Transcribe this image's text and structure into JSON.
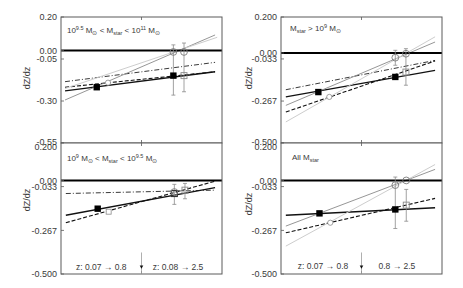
{
  "figure": {
    "y_axis_title": "dZ/dz",
    "x_axis_ticks": "unlabeled (single mid-panel tick)"
  },
  "chart_data": [
    {
      "id": "top-left",
      "type": "line",
      "row": 0,
      "frame": [
        61,
        17,
        222,
        143
      ],
      "title": "10^9.5 M⊙ < M_star < 10^11 M⊙",
      "label": {
        "x": 0.037,
        "y": 0.106,
        "segments": [
          [
            "n",
            "10"
          ],
          [
            "sup",
            "9.5"
          ],
          [
            "n",
            " M"
          ],
          [
            "sub",
            "⊙"
          ],
          [
            "n",
            " < M"
          ],
          [
            "sub",
            "star"
          ],
          [
            "n",
            " < 10"
          ],
          [
            "sup",
            "11"
          ],
          [
            "n",
            " M"
          ],
          [
            "sub",
            "⊙"
          ]
        ]
      },
      "xlabel": "",
      "ylabel": "dZ/dz",
      "xlim": [
        0,
        1
      ],
      "ylim": [
        -0.55,
        0.2
      ],
      "grid": false,
      "yticks": [
        {
          "v": 0.2,
          "label": "0.20"
        },
        {
          "v": 0.0,
          "label": "0.00"
        },
        {
          "v": -0.05,
          "label": "-0.05"
        },
        {
          "v": -0.3,
          "label": "-0.30"
        },
        {
          "v": -0.55,
          "label": "-0.55"
        }
      ],
      "series": [
        {
          "name": "solid fit",
          "style": "solid",
          "x": [
            0.025,
            0.957
          ],
          "y": [
            -0.24,
            -0.126
          ]
        },
        {
          "name": "dashed fit",
          "style": "dashed",
          "x": [
            0.025,
            0.957
          ],
          "y": [
            -0.218,
            -0.126
          ]
        },
        {
          "name": "dash-dot fit",
          "style": "dashdot",
          "x": [
            0.025,
            0.957
          ],
          "y": [
            -0.185,
            -0.07
          ]
        },
        {
          "name": "gray fit",
          "style": "gray",
          "x": [
            0.025,
            0.957
          ],
          "y": [
            -0.294,
            0.093
          ]
        },
        {
          "name": "light gray fit",
          "style": "lightgray",
          "x": [
            0.025,
            0.97
          ],
          "y": [
            -0.226,
            0.079
          ]
        }
      ],
      "points": [
        {
          "marker": "filled-square",
          "x": 0.222,
          "y": -0.218
        },
        {
          "marker": "filled-square",
          "x": 0.698,
          "y": -0.149
        },
        {
          "marker": "small-open-circle",
          "x": 0.292,
          "y": -0.191
        },
        {
          "marker": "open-circle",
          "x": 0.698,
          "y": -0.008,
          "err": [
            -0.265,
            0.034
          ]
        },
        {
          "marker": "open-circle",
          "x": 0.764,
          "y": -0.008,
          "err": [
            -0.245,
            0.045
          ]
        },
        {
          "marker": "open-square",
          "x": 0.764,
          "y": -0.149
        }
      ],
      "annotations": []
    },
    {
      "id": "top-right",
      "type": "line",
      "row": 0,
      "frame": [
        281,
        17,
        442,
        143
      ],
      "title": "M_star > 10^9 M⊙",
      "label": {
        "x": 0.056,
        "y": 0.122,
        "segments": [
          [
            "n",
            "M"
          ],
          [
            "sub",
            "star"
          ],
          [
            "n",
            " > 10"
          ],
          [
            "sup",
            "9"
          ],
          [
            "n",
            " M"
          ],
          [
            "sub",
            "⊙"
          ]
        ]
      },
      "xlabel": "",
      "ylabel": "dZ/dz",
      "xlim": [
        0,
        1
      ],
      "ylim": [
        -0.5,
        0.2
      ],
      "grid": false,
      "yticks": [
        {
          "v": 0.2,
          "label": "0.200"
        },
        {
          "v": 0.0,
          "label": "0.00"
        },
        {
          "v": -0.033,
          "label": "-0.033"
        },
        {
          "v": -0.267,
          "label": "-0.267"
        },
        {
          "v": -0.5,
          "label": "-0.500"
        }
      ],
      "series": [
        {
          "name": "solid fit",
          "style": "solid",
          "x": [
            0.03,
            0.957
          ],
          "y": [
            -0.244,
            -0.096
          ]
        },
        {
          "name": "dash-dot fit",
          "style": "dashdot",
          "x": [
            0.03,
            0.957
          ],
          "y": [
            -0.204,
            -0.041
          ]
        },
        {
          "name": "dashed fit",
          "style": "dashed",
          "x": [
            0.03,
            0.957
          ],
          "y": [
            -0.328,
            -0.044
          ]
        },
        {
          "name": "gray fit",
          "style": "gray",
          "x": [
            0.03,
            0.957
          ],
          "y": [
            -0.291,
            0.061
          ]
        },
        {
          "name": "light gray fit",
          "style": "lightgray",
          "x": [
            0.03,
            0.957
          ],
          "y": [
            -0.383,
            0.09
          ]
        }
      ],
      "points": [
        {
          "marker": "filled-square",
          "x": 0.232,
          "y": -0.217
        },
        {
          "marker": "filled-square",
          "x": 0.71,
          "y": -0.133
        },
        {
          "marker": "small-open-circle",
          "x": 0.3,
          "y": -0.244
        },
        {
          "marker": "open-circle",
          "x": 0.71,
          "y": -0.026,
          "err": [
            -0.068,
            0.015
          ]
        },
        {
          "marker": "open-circle",
          "x": 0.776,
          "y": -0.004,
          "err": [
            -0.179,
            0.024
          ]
        },
        {
          "marker": "open-square",
          "x": 0.776,
          "y": -0.106
        }
      ],
      "annotations": []
    },
    {
      "id": "bottom-left",
      "type": "line",
      "row": 1,
      "frame": [
        61,
        143,
        222,
        274
      ],
      "title": "10^9 M⊙ < M_star < 10^9.5 M⊙",
      "label": {
        "x": 0.037,
        "y": 0.104,
        "segments": [
          [
            "n",
            "10"
          ],
          [
            "sup",
            "9"
          ],
          [
            "n",
            " M"
          ],
          [
            "sub",
            "⊙"
          ],
          [
            "n",
            " < M"
          ],
          [
            "sub",
            "star"
          ],
          [
            "n",
            " < 10"
          ],
          [
            "sup",
            "9.5"
          ],
          [
            "n",
            " M"
          ],
          [
            "sub",
            "⊙"
          ]
        ]
      },
      "xlabel": "",
      "ylabel": "dZ/dz",
      "xlim": [
        0,
        1
      ],
      "ylim": [
        -0.5,
        0.2
      ],
      "grid": false,
      "yticks": [
        {
          "v": 0.2,
          "label": "0.200"
        },
        {
          "v": 0.0,
          "label": "0.00"
        },
        {
          "v": -0.033,
          "label": "-0.033"
        },
        {
          "v": -0.267,
          "label": "-0.267"
        },
        {
          "v": -0.5,
          "label": "-0.500"
        }
      ],
      "series": [
        {
          "name": "dash-dot fit",
          "style": "dashdot",
          "x": [
            0.03,
            0.957
          ],
          "y": [
            -0.07,
            -0.052
          ]
        },
        {
          "name": "solid fit",
          "style": "solid",
          "x": [
            0.03,
            0.957
          ],
          "y": [
            -0.186,
            -0.039
          ]
        },
        {
          "name": "dashed fit",
          "style": "dashed",
          "x": [
            0.03,
            0.957
          ],
          "y": [
            -0.226,
            -0.004
          ]
        }
      ],
      "points": [
        {
          "marker": "filled-square",
          "x": 0.228,
          "y": -0.151
        },
        {
          "marker": "small-open-square",
          "x": 0.296,
          "y": -0.167
        },
        {
          "marker": "open-square-dark",
          "x": 0.704,
          "y": -0.07,
          "err": [
            -0.128,
            -0.021
          ]
        },
        {
          "marker": "open-circle",
          "x": 0.704,
          "y": -0.062
        },
        {
          "marker": "open-square",
          "x": 0.77,
          "y": -0.052,
          "err": [
            -0.098,
            -0.016
          ]
        }
      ],
      "annotations": [
        {
          "kind": "text",
          "x": 0.25,
          "y": -0.463,
          "text": "z: 0.07 → 0.8"
        },
        {
          "kind": "text",
          "x": 0.727,
          "y": -0.463,
          "text": "z: 0.08 → 2.5"
        },
        {
          "kind": "down-arrow",
          "x": 0.5,
          "y_from": -0.385,
          "y_to": -0.5
        }
      ]
    },
    {
      "id": "bottom-right",
      "type": "line",
      "row": 1,
      "frame": [
        281,
        143,
        442,
        274
      ],
      "title": "All M_star",
      "label": {
        "x": 0.068,
        "y": 0.109,
        "segments": [
          [
            "n",
            "All M"
          ],
          [
            "sub",
            "star"
          ]
        ]
      },
      "xlabel": "",
      "ylabel": "dZ/dz",
      "xlim": [
        0,
        1
      ],
      "ylim": [
        -0.5,
        0.2
      ],
      "grid": false,
      "yticks": [
        {
          "v": 0.2,
          "label": "0.200"
        },
        {
          "v": 0.0,
          "label": "0.00"
        },
        {
          "v": -0.033,
          "label": "-0.033"
        },
        {
          "v": -0.267,
          "label": "-0.267"
        },
        {
          "v": -0.5,
          "label": "-0.500"
        }
      ],
      "series": [
        {
          "name": "solid fit",
          "style": "solid",
          "x": [
            0.03,
            0.957
          ],
          "y": [
            -0.186,
            -0.146
          ]
        },
        {
          "name": "gray fit",
          "style": "gray",
          "x": [
            0.03,
            0.957
          ],
          "y": [
            -0.244,
            0.059
          ]
        },
        {
          "name": "light gray fit",
          "style": "lightgray",
          "x": [
            0.03,
            0.957
          ],
          "y": [
            -0.351,
            0.085
          ]
        },
        {
          "name": "dashed fit",
          "style": "dashed",
          "x": [
            0.03,
            0.957
          ],
          "y": [
            -0.28,
            -0.096
          ]
        }
      ],
      "points": [
        {
          "marker": "filled-square",
          "x": 0.239,
          "y": -0.176
        },
        {
          "marker": "filled-square",
          "x": 0.71,
          "y": -0.155,
          "err": [
            -0.257,
            0.018
          ]
        },
        {
          "marker": "small-open-circle",
          "x": 0.306,
          "y": -0.226
        },
        {
          "marker": "open-circle",
          "x": 0.71,
          "y": -0.025
        },
        {
          "marker": "open-circle",
          "x": 0.778,
          "y": 0.0
        },
        {
          "marker": "open-square",
          "x": 0.778,
          "y": -0.132,
          "err": [
            -0.218,
            -0.048
          ]
        }
      ],
      "annotations": [
        {
          "kind": "text",
          "x": 0.261,
          "y": -0.455,
          "text": "z: 0.07 → 0.8"
        },
        {
          "kind": "text",
          "x": 0.72,
          "y": -0.455,
          "text": "0.8 → 2.5"
        },
        {
          "kind": "down-arrow",
          "x": 0.5,
          "y_from": -0.385,
          "y_to": -0.5
        }
      ]
    }
  ]
}
